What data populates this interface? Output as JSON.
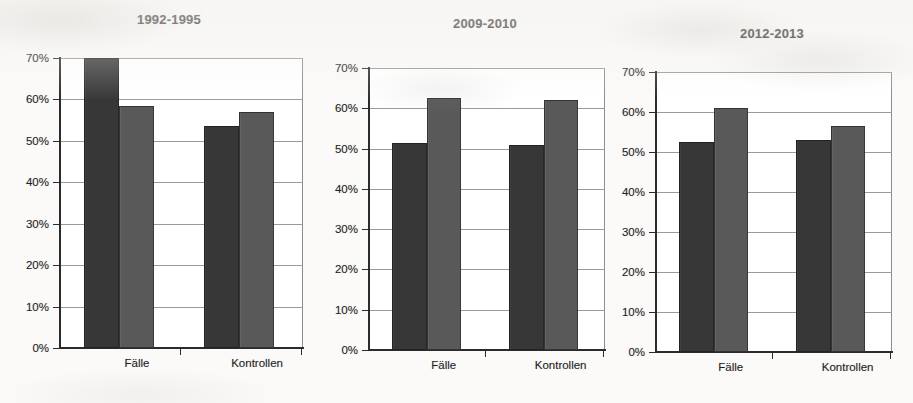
{
  "figure": {
    "name": "three-panel-grouped-bar-chart",
    "background_color": "#fbfaf8",
    "series_colors": {
      "series_a": "#3a3a3a",
      "series_b": "#5e5e5e"
    }
  },
  "chart_data": [
    {
      "type": "bar",
      "title": "1992-1995",
      "xlabel": "",
      "ylabel": "",
      "categories": [
        "Fälle",
        "Kontrollen"
      ],
      "series": [
        {
          "name": "series-a",
          "values": [
            70.0,
            53.5
          ]
        },
        {
          "name": "series-b",
          "values": [
            58.5,
            57.0
          ]
        }
      ],
      "ylim": [
        0,
        70
      ],
      "ytick_labels": [
        "70%",
        "60%",
        "50%",
        "40%",
        "30%",
        "20%",
        "10%",
        "0%"
      ],
      "ytick_values": [
        70,
        60,
        50,
        40,
        30,
        20,
        10,
        0
      ],
      "grid": true,
      "legend": "none"
    },
    {
      "type": "bar",
      "title": "2009-2010",
      "xlabel": "",
      "ylabel": "",
      "categories": [
        "Fälle",
        "Kontrollen"
      ],
      "series": [
        {
          "name": "series-a",
          "values": [
            51.5,
            51.0
          ]
        },
        {
          "name": "series-b",
          "values": [
            62.5,
            62.0
          ]
        }
      ],
      "ylim": [
        0,
        70
      ],
      "ytick_labels": [
        "70%",
        "60%",
        "50%",
        "40%",
        "30%",
        "20%",
        "10%",
        "0%"
      ],
      "ytick_values": [
        70,
        60,
        50,
        40,
        30,
        20,
        10,
        0
      ],
      "grid": true,
      "legend": "none"
    },
    {
      "type": "bar",
      "title": "2012-2013",
      "xlabel": "",
      "ylabel": "",
      "categories": [
        "Fälle",
        "Kontrollen"
      ],
      "series": [
        {
          "name": "series-a",
          "values": [
            52.5,
            53.0
          ]
        },
        {
          "name": "series-b",
          "values": [
            61.0,
            56.5
          ]
        }
      ],
      "ylim": [
        0,
        70
      ],
      "ytick_labels": [
        "70%",
        "60%",
        "50%",
        "40%",
        "30%",
        "20%",
        "10%",
        "0%"
      ],
      "ytick_values": [
        70,
        60,
        50,
        40,
        30,
        20,
        10,
        0
      ],
      "grid": true,
      "legend": "none"
    }
  ],
  "panels": [
    {
      "title": "1992-1995",
      "title_left": 137,
      "title_top": 12,
      "plot_left": 60,
      "plot_top": 58,
      "plot_width": 243,
      "plot_height": 290,
      "ytick_labels": [
        "70%",
        "60%",
        "50%",
        "40%",
        "30%",
        "20%",
        "10%",
        "0%"
      ],
      "ytick_values": [
        70,
        60,
        50,
        40,
        30,
        20,
        10,
        0
      ],
      "groups": [
        {
          "label": "Fälle",
          "center_pct": 24.5,
          "bars": [
            {
              "series": "series-a",
              "value": 70.0,
              "left_pct": 9.9,
              "width_pct": 14.4
            },
            {
              "series": "series-b",
              "value": 58.5,
              "left_pct": 24.3,
              "width_pct": 14.4
            }
          ]
        },
        {
          "label": "Kontrollen",
          "center_pct": 73.9,
          "bars": [
            {
              "series": "series-a",
              "value": 53.5,
              "left_pct": 59.3,
              "width_pct": 14.4
            },
            {
              "series": "series-b",
              "value": 57.0,
              "left_pct": 73.7,
              "width_pct": 14.4
            }
          ]
        }
      ]
    },
    {
      "title": "2009-2010",
      "title_left": 453,
      "title_top": 16,
      "plot_left": 369,
      "plot_top": 68,
      "plot_width": 236,
      "plot_height": 282,
      "ytick_labels": [
        "70%",
        "60%",
        "50%",
        "40%",
        "30%",
        "20%",
        "10%",
        "0%"
      ],
      "ytick_values": [
        70,
        60,
        50,
        40,
        30,
        20,
        10,
        0
      ],
      "groups": [
        {
          "label": "Fälle",
          "center_pct": 24.5,
          "bars": [
            {
              "series": "series-a",
              "value": 51.5,
              "left_pct": 9.9,
              "width_pct": 14.6
            },
            {
              "series": "series-b",
              "value": 62.5,
              "left_pct": 24.5,
              "width_pct": 14.6
            }
          ]
        },
        {
          "label": "Kontrollen",
          "center_pct": 74.0,
          "bars": [
            {
              "series": "series-a",
              "value": 51.0,
              "left_pct": 59.4,
              "width_pct": 14.6
            },
            {
              "series": "series-b",
              "value": 62.0,
              "left_pct": 74.0,
              "width_pct": 14.6
            }
          ]
        }
      ]
    },
    {
      "title": "2012-2013",
      "title_left": 740,
      "title_top": 26,
      "plot_left": 656,
      "plot_top": 72,
      "plot_width": 236,
      "plot_height": 280,
      "ytick_labels": [
        "70%",
        "60%",
        "50%",
        "40%",
        "30%",
        "20%",
        "10%",
        "0%"
      ],
      "ytick_values": [
        70,
        60,
        50,
        40,
        30,
        20,
        10,
        0
      ],
      "groups": [
        {
          "label": "Fälle",
          "center_pct": 24.5,
          "bars": [
            {
              "series": "series-a",
              "value": 52.5,
              "left_pct": 9.9,
              "width_pct": 14.6
            },
            {
              "series": "series-b",
              "value": 61.0,
              "left_pct": 24.5,
              "width_pct": 14.6
            }
          ]
        },
        {
          "label": "Kontrollen",
          "center_pct": 74.0,
          "bars": [
            {
              "series": "series-a",
              "value": 53.0,
              "left_pct": 59.4,
              "width_pct": 14.6
            },
            {
              "series": "series-b",
              "value": 56.5,
              "left_pct": 74.0,
              "width_pct": 14.6
            }
          ]
        }
      ]
    }
  ]
}
